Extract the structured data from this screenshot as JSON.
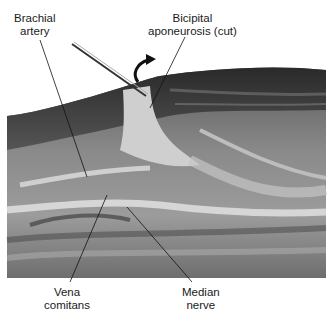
{
  "figure": {
    "labels": {
      "brachial_artery": [
        "Brachial",
        "artery"
      ],
      "bicipital_aponeurosis": [
        "Bicipital",
        "aponeurosis (cut)"
      ],
      "vena_comitans": [
        "Vena",
        "comitans"
      ],
      "median_nerve": [
        "Median",
        "nerve"
      ]
    }
  }
}
